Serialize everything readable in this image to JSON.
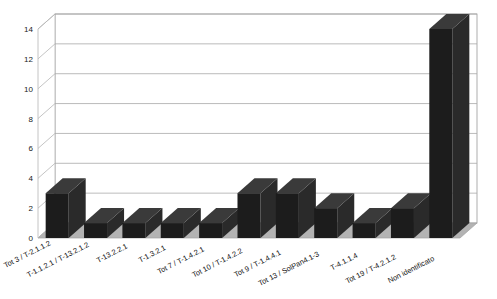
{
  "chart_data": {
    "type": "bar",
    "title": "",
    "subtitle": "",
    "xlabel": "",
    "ylabel": "",
    "ylim": [
      0,
      14
    ],
    "yticks": [
      "0",
      "2",
      "4",
      "6",
      "8",
      "10",
      "12",
      "14"
    ],
    "ytick_values": [
      0,
      2,
      4,
      6,
      8,
      10,
      12,
      14
    ],
    "grid": true,
    "grid_axis": "y",
    "legend": false,
    "legend_position": "none",
    "three_d": true,
    "bar_color": "#1c1c1c",
    "floor_color": "#b3b3b3",
    "grid_color": "#aaaaaa",
    "frame_color": "#999999",
    "background_color": "#ffffff",
    "categories": [
      "Tot 3 / T-2.1.1.2",
      "T-1.1.2.1 / T-13.2.1.2",
      "T-13.2.2.1",
      "T-1.3.2.1",
      "Tot 7 / T-1.4.2.1",
      "Tot 10 / T-1.4.2.2",
      "Tot 9 / T-1.4.4.1",
      "Tot 13 / SolPan4.1-3",
      "T-4.1.1.4",
      "Tot 19 / T-4.2.1.2",
      "Non identificato"
    ],
    "values": [
      3,
      1,
      1,
      1,
      1,
      3,
      3,
      2,
      1,
      2,
      14
    ]
  }
}
